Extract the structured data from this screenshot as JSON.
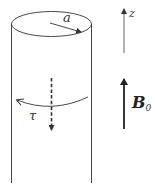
{
  "diagram": {
    "type": "physics-figure",
    "labels": {
      "radius": "a",
      "axis": "z",
      "torque": "τ",
      "field_symbol": "B",
      "field_subscript": "0"
    },
    "elements": [
      {
        "name": "cylinder",
        "description": "vertical cylinder with elliptical top face"
      },
      {
        "name": "radius-arrow",
        "description": "arrow from top center to rim, labeled a"
      },
      {
        "name": "torque-arrow",
        "description": "curved arrow around cylinder, labeled τ, pointing left"
      },
      {
        "name": "axis-dashed-arrow",
        "description": "dashed downward arrow along the cylinder axis"
      },
      {
        "name": "z-axis-arrow",
        "description": "thin upward arrow labeled z"
      },
      {
        "name": "field-arrow",
        "description": "thick upward arrow labeled B0"
      }
    ],
    "colors": {
      "line": "#333333",
      "background": "#ffffff"
    }
  }
}
